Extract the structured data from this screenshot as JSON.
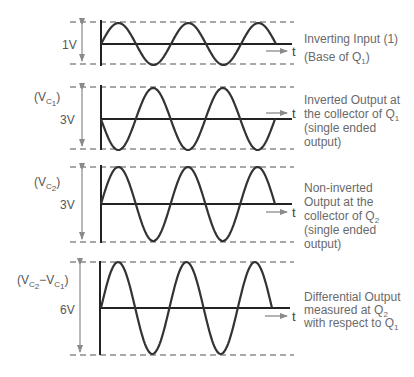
{
  "colors": {
    "wave": "#333333",
    "dashed": "#8a8a8a",
    "arrow": "#8a8a8a",
    "text": "#666666"
  },
  "axis_label_t": "t",
  "panels": [
    {
      "id": "inverting-input",
      "name_label": "",
      "amplitude_label": "1V",
      "top": 22,
      "zero": 44,
      "bottom": 64,
      "amp": 21,
      "x0": 101,
      "x_end": 276,
      "half_periods": 5,
      "inverted": false,
      "arrow_y": 51,
      "description": [
        "Inverting Input (1)",
        "(Base of Q1)"
      ]
    },
    {
      "id": "inverted-output",
      "name_label": "(VC1)",
      "amplitude_label": "3V",
      "top": 87,
      "zero": 119,
      "bottom": 149,
      "amp": 31,
      "x0": 101,
      "x_end": 275,
      "half_periods": 5,
      "inverted": true,
      "arrow_y": 113,
      "description": [
        "Inverted Output at",
        "the collector of Q1",
        "(single ended",
        "output)"
      ]
    },
    {
      "id": "non-inverted-output",
      "name_label": "(VC2)",
      "amplitude_label": "3V",
      "top": 167,
      "zero": 204,
      "bottom": 242,
      "amp": 37,
      "x0": 101,
      "x_end": 275,
      "half_periods": 5,
      "inverted": false,
      "arrow_y": 212,
      "description": [
        "Non-inverted",
        "Output at the",
        "collector of Q2",
        "(single ended",
        "output)"
      ]
    },
    {
      "id": "differential-output",
      "name_label": "(VC2−VC1)",
      "amplitude_label": "6V",
      "top": 262,
      "zero": 308,
      "bottom": 355,
      "amp": 46,
      "x0": 101,
      "x_end": 272,
      "half_periods": 5,
      "inverted": false,
      "arrow_y": 316,
      "description": [
        "Differential Output",
        "measured at Q2",
        "with respect to Q1"
      ]
    }
  ]
}
